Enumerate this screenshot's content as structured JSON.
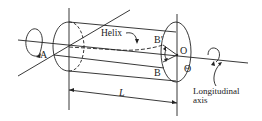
{
  "diagram": {
    "labels": {
      "a": "A",
      "helix": "Helix",
      "b_prime": "B′",
      "b": "B",
      "o": "O",
      "theta": "Θ",
      "length": "L",
      "axis_line1": "Longitudinal",
      "axis_line2": "axis"
    },
    "colors": {
      "stroke": "#222222",
      "background": "#ffffff"
    }
  }
}
